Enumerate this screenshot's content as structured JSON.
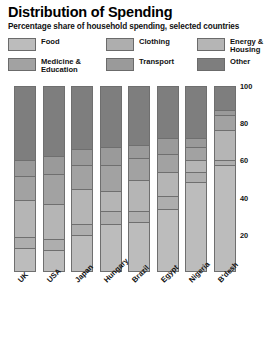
{
  "header": {
    "title": "Distribution of Spending",
    "subtitle": "Percentage share of household spending, selected countries"
  },
  "legend": {
    "items": [
      {
        "label": "Food",
        "color": "#bcbcbc",
        "col": 0,
        "row": 0
      },
      {
        "label": "Clothing",
        "color": "#aeaeae",
        "col": 1,
        "row": 0
      },
      {
        "label": "Energy &\nHousing",
        "color": "#b5b5b5",
        "col": 2,
        "row": 0
      },
      {
        "label": "Medicine &\nEducation",
        "color": "#a2a2a2",
        "col": 0,
        "row": 1
      },
      {
        "label": "Transport",
        "color": "#9a9a9a",
        "col": 1,
        "row": 1
      },
      {
        "label": "Other",
        "color": "#7e7e7e",
        "col": 2,
        "row": 1
      }
    ]
  },
  "axis": {
    "ticks": [
      "100",
      "80",
      "60",
      "40",
      "20"
    ],
    "tick_values": [
      100,
      80,
      60,
      40,
      20
    ],
    "min": 0,
    "max": 100
  },
  "chart_data": {
    "type": "bar",
    "title": "Distribution of Spending",
    "subtitle": "Percentage share of household spending, selected countries",
    "xlabel": "",
    "ylabel": "",
    "ylim": [
      0,
      100
    ],
    "stacked": true,
    "stack_percent": true,
    "grid": false,
    "legend_position": "top",
    "categories": [
      "UK",
      "USA",
      "Japan",
      "Hungary",
      "Brazil",
      "Egypt",
      "Nigeria",
      "B'desh"
    ],
    "series": [
      {
        "name": "Food",
        "color": "#bcbcbc",
        "values": [
          12,
          11,
          19,
          25,
          26,
          33,
          48,
          57
        ]
      },
      {
        "name": "Clothing",
        "color": "#aeaeae",
        "values": [
          6,
          6,
          6,
          7,
          6,
          7,
          5,
          3
        ]
      },
      {
        "name": "Energy & Housing",
        "color": "#b5b5b5",
        "values": [
          20,
          19,
          19,
          11,
          17,
          13,
          7,
          16
        ]
      },
      {
        "name": "Medicine & Education",
        "color": "#a2a2a2",
        "values": [
          13,
          16,
          13,
          14,
          12,
          10,
          7,
          8
        ]
      },
      {
        "name": "Transport",
        "color": "#9a9a9a",
        "values": [
          9,
          10,
          9,
          10,
          7,
          9,
          5,
          3
        ]
      },
      {
        "name": "Other",
        "color": "#7e7e7e",
        "values": [
          40,
          38,
          34,
          33,
          32,
          28,
          28,
          13
        ]
      }
    ]
  }
}
